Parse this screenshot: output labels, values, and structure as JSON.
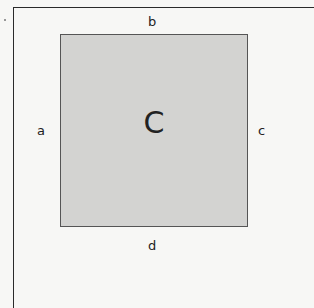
{
  "diagram": {
    "center_label": "C",
    "sides": {
      "top": "b",
      "left": "a",
      "right": "c",
      "bottom": "d"
    },
    "colors": {
      "square_fill": "#d3d3d1",
      "square_border": "#555555",
      "frame": "#2a2a2a"
    }
  }
}
